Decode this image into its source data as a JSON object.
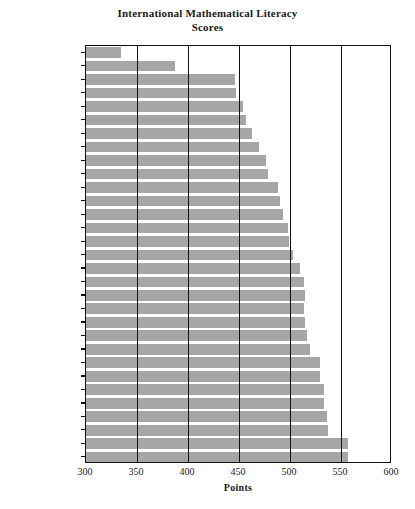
{
  "chart_data": {
    "type": "bar",
    "orientation": "horizontal",
    "title": "International Mathematical Literacy Scores",
    "title_lines": [
      "International Mathematical Literacy",
      "Scores"
    ],
    "xlabel": "Points",
    "ylabel": "",
    "xlim": [
      300,
      600
    ],
    "xticks": [
      300,
      350,
      400,
      450,
      500,
      550,
      600
    ],
    "grid": true,
    "legend": null,
    "bar_color": "#a6a6a6",
    "axis_color": "#111111",
    "categories": [
      "Brazil",
      "Mexico",
      "Luxembourg",
      "Greece",
      "Portugal",
      "Italy",
      "Latvia",
      "Poland",
      "Spain",
      "Russia",
      "Hungary",
      "Germany",
      "USA",
      "Czech Rep.",
      "Norway",
      "Ireland",
      "Sweden",
      "Liechtenstein",
      "Iceland",
      "Denmark",
      "Austria",
      "France",
      "Belgium",
      "U.K.",
      "Switzerland",
      "Canada",
      "Australia",
      "Finland",
      "New Zealand",
      "Japan",
      "Korea"
    ],
    "values": [
      334,
      387,
      446,
      447,
      454,
      457,
      463,
      470,
      476,
      478,
      488,
      490,
      493,
      498,
      499,
      503,
      510,
      514,
      515,
      514,
      515,
      517,
      520,
      529,
      529,
      533,
      533,
      536,
      537,
      557,
      557
    ]
  }
}
